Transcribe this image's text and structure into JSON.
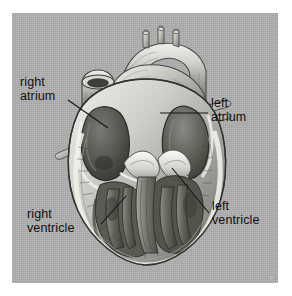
{
  "figure": {
    "kind": "anatomical-illustration",
    "rendering": "grayscale engraving / halftone",
    "plate_background_color": "#aeaeae",
    "page_background_color": "#ffffff",
    "label_text_color": "#111111",
    "leader_line_color": "#141414"
  },
  "labels": [
    {
      "id": "right-atrium",
      "line1": "right",
      "line2": "atrium",
      "text": "right atrium",
      "position": "upper-left",
      "leader": {
        "from_x": 68,
        "from_y": 100,
        "to_x": 108,
        "to_y": 128
      }
    },
    {
      "id": "left-atrium",
      "line1": "left",
      "line2": "atrium",
      "text": "left atrium",
      "position": "upper-right",
      "leader": {
        "from_x": 208,
        "from_y": 113,
        "to_x": 160,
        "to_y": 113
      }
    },
    {
      "id": "right-ventricle",
      "line1": "right",
      "line2": "ventricle",
      "text": "right ventricle",
      "position": "lower-left",
      "leader": {
        "from_x": 101,
        "from_y": 224,
        "to_x": 126,
        "to_y": 196
      }
    },
    {
      "id": "left-ventricle",
      "line1": "left",
      "line2": "ventricle",
      "text": "left ventricle",
      "position": "lower-right",
      "leader": {
        "from_x": 209,
        "from_y": 213,
        "to_x": 172,
        "to_y": 168
      }
    }
  ],
  "anatomy_parts": [
    {
      "name": "aortic-arch",
      "description": "great vessel arching over the top of the heart"
    },
    {
      "name": "brachiocephalic-branches",
      "description": "three small vessel stubs on top of the arch"
    },
    {
      "name": "superior-vena-cava",
      "description": "cut vessel stump at upper left"
    },
    {
      "name": "pulmonary-trunk",
      "description": "vessel crossing in front of the aorta"
    },
    {
      "name": "right-atrium-cavity",
      "description": "dark open chamber, upper left of the section"
    },
    {
      "name": "left-atrium-cavity",
      "description": "dark open chamber, upper right of the section"
    },
    {
      "name": "atrioventricular-valves",
      "description": "pale leaflets between atria and ventricles"
    },
    {
      "name": "interventricular-septum",
      "description": "muscular wall dividing the ventricles"
    },
    {
      "name": "right-ventricle-cavity",
      "description": "chamber with trabeculae, lower left"
    },
    {
      "name": "left-ventricle-cavity",
      "description": "thick-walled chamber, lower right"
    },
    {
      "name": "myocardium-wall",
      "description": "striated outer muscle wall of the heart"
    },
    {
      "name": "apex",
      "description": "rounded bottom tip of the heart"
    }
  ]
}
